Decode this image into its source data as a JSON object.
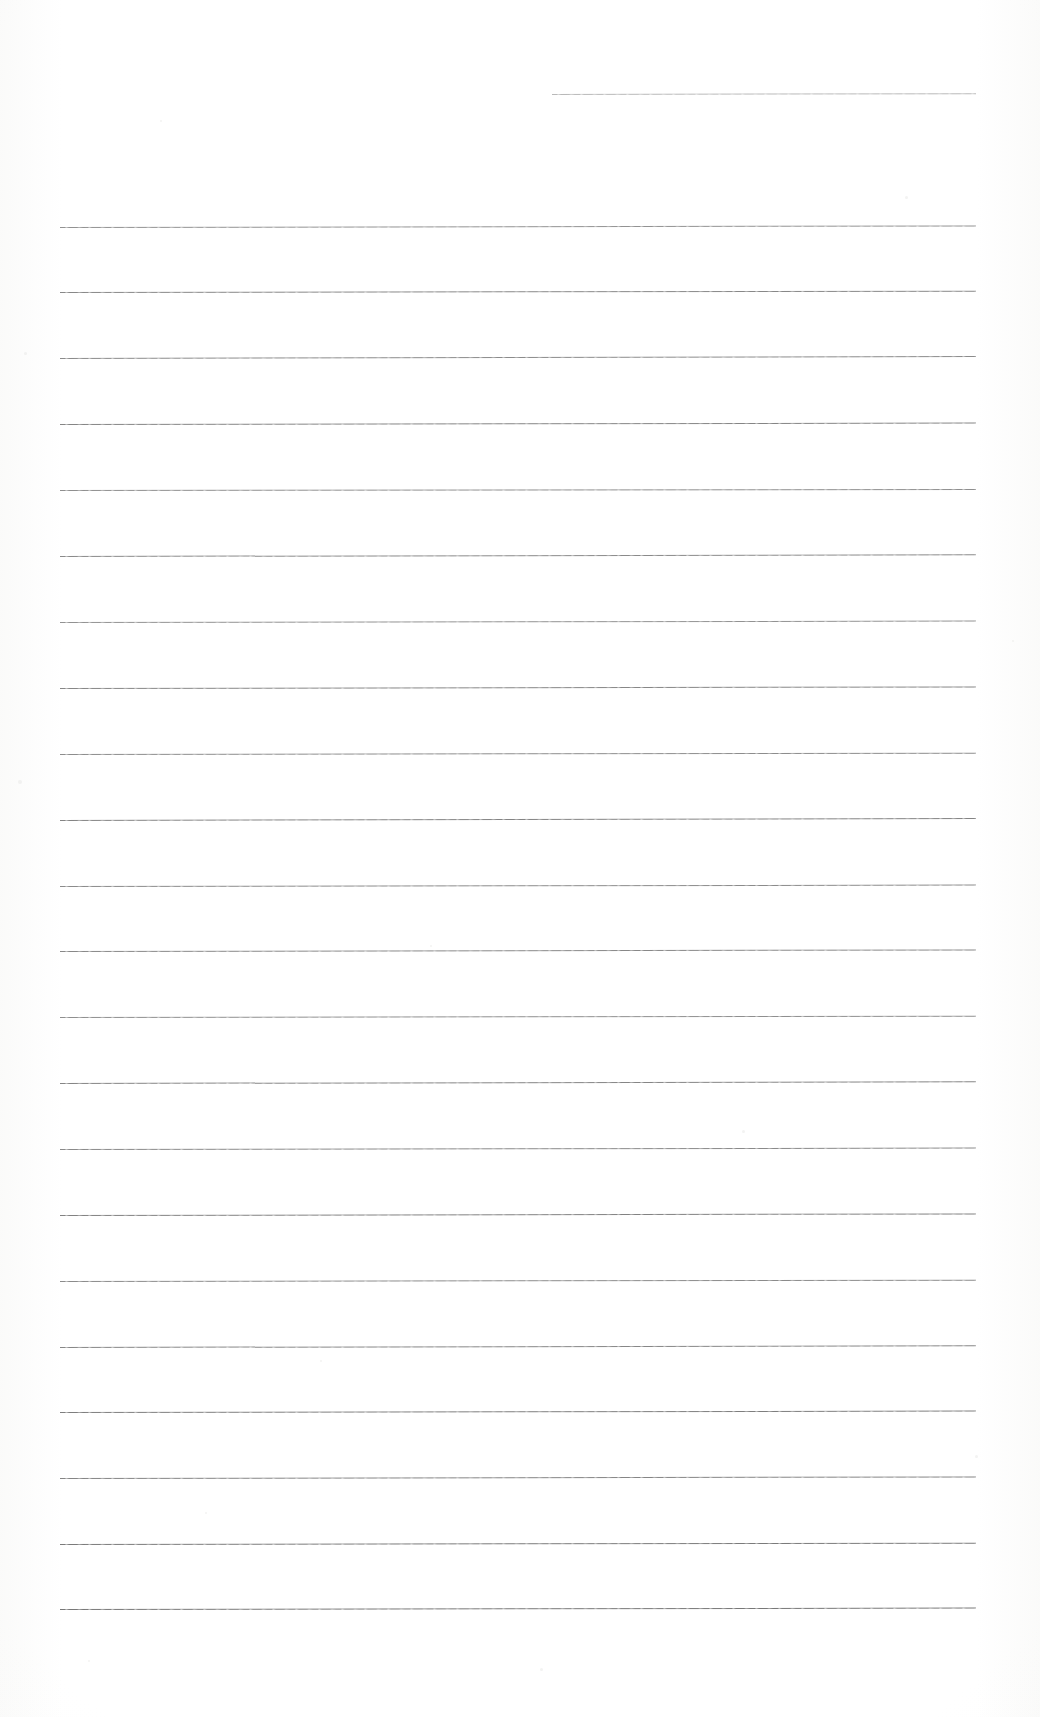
{
  "document": {
    "kind": "scanned-lined-notepaper",
    "title": "Blank Ruled Notepaper Scan",
    "page_width": 1040,
    "page_height": 1717,
    "background_color": "#ffffff",
    "ink_color": "#5b5b5b",
    "written_text": "",
    "visible_text_content": "none — the page is blank apart from the ruled lines"
  },
  "ruling": {
    "line_count": 22,
    "nominal_spacing_px": 65.8,
    "full_line_left_px": 60,
    "full_line_right_px": 976,
    "first_full_line_y_px": 227,
    "last_line_y_px": 1609,
    "top_margin_note": "short partial rule at top right only",
    "bottom_margin_px": 108
  },
  "lines": [
    {
      "id": "rule-00",
      "y": 94,
      "x": 552,
      "width": 424,
      "opacity": 0.42,
      "tilt": -0.11,
      "weight": 0.9
    },
    {
      "id": "rule-01",
      "y": 227,
      "x": 60,
      "width": 916,
      "opacity": 0.66,
      "tilt": -0.1,
      "weight": 1.0
    },
    {
      "id": "rule-02",
      "y": 292,
      "x": 60,
      "width": 916,
      "opacity": 0.72,
      "tilt": -0.08,
      "weight": 1.0
    },
    {
      "id": "rule-03",
      "y": 358,
      "x": 60,
      "width": 916,
      "opacity": 0.7,
      "tilt": -0.12,
      "weight": 1.0
    },
    {
      "id": "rule-04",
      "y": 424,
      "x": 60,
      "width": 916,
      "opacity": 0.74,
      "tilt": -0.09,
      "weight": 1.05
    },
    {
      "id": "rule-05",
      "y": 490,
      "x": 60,
      "width": 916,
      "opacity": 0.68,
      "tilt": -0.07,
      "weight": 1.0
    },
    {
      "id": "rule-06",
      "y": 556,
      "x": 60,
      "width": 916,
      "opacity": 0.71,
      "tilt": -0.11,
      "weight": 1.0
    },
    {
      "id": "rule-07",
      "y": 622,
      "x": 60,
      "width": 916,
      "opacity": 0.66,
      "tilt": -0.09,
      "weight": 1.0
    },
    {
      "id": "rule-08",
      "y": 688,
      "x": 60,
      "width": 916,
      "opacity": 0.73,
      "tilt": -0.1,
      "weight": 1.05
    },
    {
      "id": "rule-09",
      "y": 754,
      "x": 60,
      "width": 916,
      "opacity": 0.69,
      "tilt": -0.08,
      "weight": 1.0
    },
    {
      "id": "rule-10",
      "y": 820,
      "x": 60,
      "width": 916,
      "opacity": 0.75,
      "tilt": -0.12,
      "weight": 1.05
    },
    {
      "id": "rule-11",
      "y": 886,
      "x": 60,
      "width": 916,
      "opacity": 0.7,
      "tilt": -0.09,
      "weight": 1.0
    },
    {
      "id": "rule-12",
      "y": 951,
      "x": 60,
      "width": 916,
      "opacity": 0.72,
      "tilt": -0.1,
      "weight": 1.0
    },
    {
      "id": "rule-13",
      "y": 1017,
      "x": 60,
      "width": 916,
      "opacity": 0.68,
      "tilt": -0.08,
      "weight": 1.0
    },
    {
      "id": "rule-14",
      "y": 1083,
      "x": 60,
      "width": 916,
      "opacity": 0.74,
      "tilt": -0.11,
      "weight": 1.05
    },
    {
      "id": "rule-15",
      "y": 1149,
      "x": 60,
      "width": 916,
      "opacity": 0.71,
      "tilt": -0.09,
      "weight": 1.0
    },
    {
      "id": "rule-16",
      "y": 1215,
      "x": 60,
      "width": 916,
      "opacity": 0.76,
      "tilt": -0.1,
      "weight": 1.05
    },
    {
      "id": "rule-17",
      "y": 1281,
      "x": 60,
      "width": 916,
      "opacity": 0.7,
      "tilt": -0.08,
      "weight": 1.0
    },
    {
      "id": "rule-18",
      "y": 1347,
      "x": 60,
      "width": 916,
      "opacity": 0.73,
      "tilt": -0.11,
      "weight": 1.0
    },
    {
      "id": "rule-19",
      "y": 1412,
      "x": 60,
      "width": 916,
      "opacity": 0.78,
      "tilt": -0.09,
      "weight": 1.1
    },
    {
      "id": "rule-20",
      "y": 1478,
      "x": 60,
      "width": 916,
      "opacity": 0.74,
      "tilt": -0.1,
      "weight": 1.05
    },
    {
      "id": "rule-21",
      "y": 1544,
      "x": 60,
      "width": 916,
      "opacity": 0.8,
      "tilt": -0.08,
      "weight": 1.1
    },
    {
      "id": "rule-22",
      "y": 1609,
      "x": 60,
      "width": 916,
      "opacity": 0.82,
      "tilt": -0.09,
      "weight": 1.1
    }
  ],
  "specks": [
    {
      "x": 24,
      "y": 352,
      "size": 3
    },
    {
      "x": 160,
      "y": 120,
      "size": 2
    },
    {
      "x": 905,
      "y": 196,
      "size": 3
    },
    {
      "x": 18,
      "y": 780,
      "size": 4
    },
    {
      "x": 320,
      "y": 1360,
      "size": 2
    },
    {
      "x": 742,
      "y": 1130,
      "size": 3
    },
    {
      "x": 1012,
      "y": 640,
      "size": 2
    },
    {
      "x": 540,
      "y": 1668,
      "size": 3
    },
    {
      "x": 88,
      "y": 1660,
      "size": 2
    },
    {
      "x": 430,
      "y": 945,
      "size": 2
    },
    {
      "x": 975,
      "y": 1455,
      "size": 3
    },
    {
      "x": 205,
      "y": 1512,
      "size": 2
    }
  ]
}
